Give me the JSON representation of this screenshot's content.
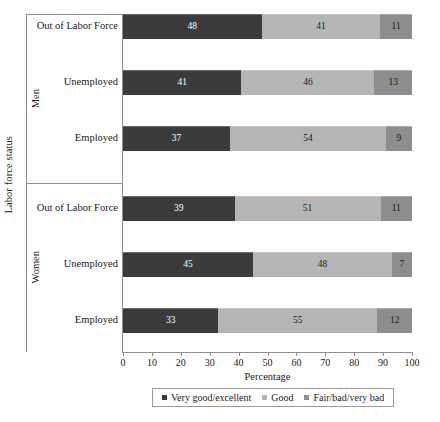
{
  "chart_data": {
    "type": "bar",
    "orientation": "horizontal",
    "stacked": true,
    "title": "",
    "xlabel": "Percentage",
    "ylabel": "Labor force status",
    "xlim": [
      0,
      100
    ],
    "xticks": [
      0,
      10,
      20,
      30,
      40,
      50,
      60,
      70,
      80,
      90,
      100
    ],
    "grid": false,
    "legend_position": "bottom",
    "group_labels": [
      "Men",
      "Women"
    ],
    "categories": [
      "Out of Labor Force",
      "Unemployed",
      "Employed",
      "Out of Labor Force",
      "Unemployed",
      "Employed"
    ],
    "series": [
      {
        "name": "Very good/excellent",
        "color": "#3b3b3b",
        "label_color": "#ffffff",
        "values": [
          48,
          41,
          37,
          39,
          45,
          33
        ]
      },
      {
        "name": "Good",
        "color": "#b5b5b5",
        "label_color": "#1a1a1a",
        "values": [
          41,
          46,
          54,
          51,
          48,
          55
        ]
      },
      {
        "name": "Fair/bad/very bad",
        "color": "#8d8d8d",
        "label_color": "#1a1a1a",
        "values": [
          11,
          13,
          9,
          11,
          7,
          12
        ]
      }
    ],
    "groups": [
      {
        "label": "Men",
        "rows": [
          {
            "category": "Out of Labor Force",
            "values": [
              48,
              41,
              11
            ]
          },
          {
            "category": "Unemployed",
            "values": [
              41,
              46,
              13
            ]
          },
          {
            "category": "Employed",
            "values": [
              37,
              54,
              9
            ]
          }
        ]
      },
      {
        "label": "Women",
        "rows": [
          {
            "category": "Out of Labor Force",
            "values": [
              39,
              51,
              11
            ]
          },
          {
            "category": "Unemployed",
            "values": [
              45,
              48,
              7
            ]
          },
          {
            "category": "Employed",
            "values": [
              33,
              55,
              12
            ]
          }
        ]
      }
    ],
    "legend": [
      {
        "label": "Very good/excellent",
        "color": "#3b3b3b"
      },
      {
        "label": "Good",
        "color": "#b5b5b5"
      },
      {
        "label": "Fair/bad/very bad",
        "color": "#8d8d8d"
      }
    ]
  }
}
